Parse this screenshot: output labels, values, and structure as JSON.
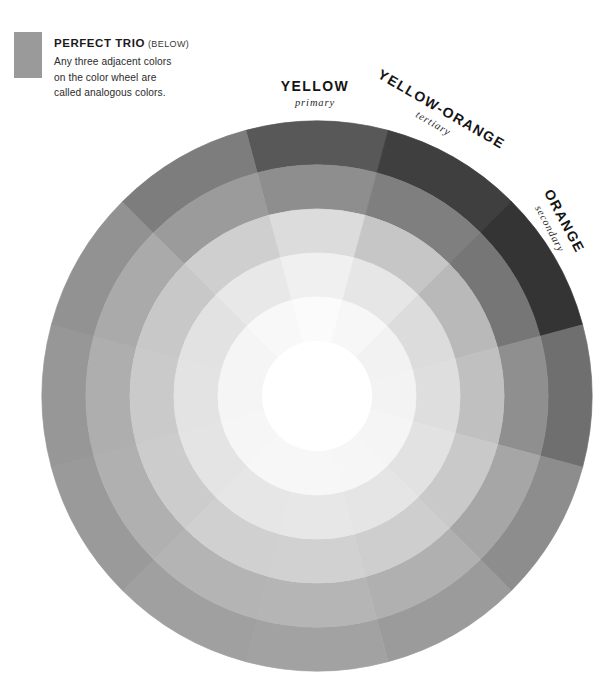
{
  "legend": {
    "swatch_color": "#9a9a9a",
    "title": "PERFECT TRIO",
    "title_note": "(BELOW)",
    "body_lines": [
      "Any three adjacent colors",
      "on the color wheel are",
      "called analogous colors."
    ]
  },
  "wheel": {
    "center_x": 317,
    "center_y": 396,
    "outer_radius": 275,
    "inner_hole_radius": 55,
    "sector_count": 12,
    "ring_count": 5,
    "ring_radii": [
      275,
      231,
      187,
      143,
      99,
      55
    ],
    "labels": [
      {
        "name": "YELLOW",
        "role": "primary",
        "rotation": 0
      },
      {
        "name": "YELLOW-ORANGE",
        "role": "tertiary",
        "rotation": 30
      },
      {
        "name": "ORANGE",
        "role": "secondary",
        "rotation": 62
      }
    ]
  },
  "chart_data": {
    "type": "pie",
    "xlabel": "",
    "ylabel": "",
    "legend_position": "top-left",
    "grid": false,
    "annotations": [
      "PERFECT TRIO (BELOW) — Any three adjacent colors on the color wheel are called analogous colors."
    ],
    "geometry": {
      "sectors": 12,
      "degrees_per_sector": 30,
      "rings": 5,
      "ring_outer_radii_px": [
        275,
        231,
        187,
        143,
        99
      ],
      "hole_radius_px": 55,
      "start_angle_deg": -105
    },
    "categories": [
      "yellow",
      "yellow-orange",
      "orange",
      "red-orange",
      "red",
      "red-violet",
      "violet",
      "blue-violet",
      "blue",
      "blue-green",
      "green",
      "yellow-green"
    ],
    "ring_names": [
      "outer",
      "ring-2",
      "ring-3",
      "ring-4",
      "inner"
    ],
    "series": [
      {
        "name": "outer",
        "values": [
          "#585858",
          "#3f3f3f",
          "#343434",
          "#6f6f6f",
          "#8d8d8d",
          "#9b9b9b",
          "#a2a2a2",
          "#a0a0a0",
          "#9a9a9a",
          "#979797",
          "#929292",
          "#7d7d7d"
        ]
      },
      {
        "name": "ring-2",
        "values": [
          "#8e8e8e",
          "#7f7f7f",
          "#767676",
          "#8f8f8f",
          "#a6a6a6",
          "#b0b0b0",
          "#b5b5b5",
          "#b4b4b4",
          "#b0b0b0",
          "#aeaeae",
          "#aaaaaa",
          "#9b9b9b"
        ]
      },
      {
        "name": "ring-3",
        "values": [
          "#dcdcdc",
          "#c6c6c6",
          "#b9b9b9",
          "#c0c0c0",
          "#c9c9c9",
          "#cecece",
          "#d1d1d1",
          "#d0d0d0",
          "#cccccc",
          "#cacaca",
          "#c8c8c8",
          "#cfcfcf"
        ]
      },
      {
        "name": "ring-4",
        "values": [
          "#f0f0f0",
          "#e6e6e6",
          "#dcdcdc",
          "#dedede",
          "#e2e2e2",
          "#e5e5e5",
          "#e7e7e7",
          "#e6e6e6",
          "#e4e4e4",
          "#e3e3e3",
          "#e2e2e2",
          "#e8e8e8"
        ]
      },
      {
        "name": "inner",
        "values": [
          "#fbfbfb",
          "#f7f7f7",
          "#f2f2f2",
          "#f3f3f3",
          "#f5f5f5",
          "#f6f6f6",
          "#f7f7f7",
          "#f7f7f7",
          "#f6f6f6",
          "#f5f5f5",
          "#f5f5f5",
          "#f8f8f8"
        ]
      }
    ],
    "hole_color": "#ffffff",
    "background": "#ffffff"
  }
}
